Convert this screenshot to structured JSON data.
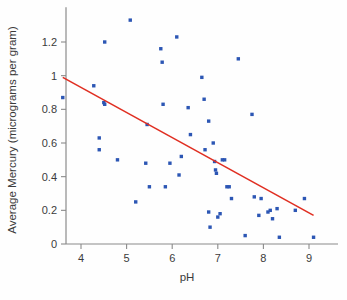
{
  "chart_data": {
    "type": "scatter",
    "title": "",
    "xlabel": "pH",
    "ylabel": "Average Mercury (micrograms per gram)",
    "xlim": [
      3.4,
      9.5
    ],
    "ylim": [
      0,
      1.4
    ],
    "xticks": [
      4,
      5,
      6,
      7,
      8,
      9
    ],
    "xtick_labels": [
      "4",
      "5",
      "6",
      "7",
      "8",
      "9"
    ],
    "yticks": [
      0,
      0.2,
      0.4,
      0.6,
      0.8,
      1,
      1.2
    ],
    "ytick_labels": [
      "0",
      "0.2",
      "0.4",
      "0.6",
      "0.8",
      "1",
      "1.2"
    ],
    "grid": false,
    "legend": "none",
    "point_color": "#2c56b4",
    "line_color": "#e02f22",
    "axis_color": "#8a8a8a",
    "series": [
      {
        "name": "Lakes",
        "marker": "square",
        "points": [
          [
            3.6,
            0.87
          ],
          [
            4.28,
            0.94
          ],
          [
            4.4,
            0.63
          ],
          [
            4.4,
            0.56
          ],
          [
            4.52,
            1.2
          ],
          [
            4.5,
            0.84
          ],
          [
            4.52,
            0.83
          ],
          [
            4.8,
            0.5
          ],
          [
            5.08,
            1.33
          ],
          [
            5.2,
            0.25
          ],
          [
            5.42,
            0.48
          ],
          [
            5.45,
            0.71
          ],
          [
            5.5,
            0.34
          ],
          [
            5.75,
            1.16
          ],
          [
            5.78,
            1.08
          ],
          [
            5.8,
            0.83
          ],
          [
            5.85,
            0.34
          ],
          [
            5.95,
            0.48
          ],
          [
            6.1,
            1.23
          ],
          [
            6.15,
            0.41
          ],
          [
            6.2,
            0.52
          ],
          [
            6.35,
            0.81
          ],
          [
            6.4,
            0.65
          ],
          [
            6.65,
            0.99
          ],
          [
            6.7,
            0.86
          ],
          [
            6.72,
            0.56
          ],
          [
            6.8,
            0.73
          ],
          [
            6.8,
            0.19
          ],
          [
            6.83,
            0.1
          ],
          [
            6.9,
            0.6
          ],
          [
            6.93,
            0.49
          ],
          [
            6.95,
            0.44
          ],
          [
            6.97,
            0.42
          ],
          [
            7.0,
            0.16
          ],
          [
            7.05,
            0.18
          ],
          [
            7.1,
            0.5
          ],
          [
            7.15,
            0.5
          ],
          [
            7.2,
            0.34
          ],
          [
            7.25,
            0.34
          ],
          [
            7.3,
            0.27
          ],
          [
            7.45,
            1.1
          ],
          [
            7.6,
            0.05
          ],
          [
            7.75,
            0.77
          ],
          [
            7.8,
            0.28
          ],
          [
            7.9,
            0.17
          ],
          [
            7.95,
            0.27
          ],
          [
            8.1,
            0.19
          ],
          [
            8.15,
            0.2
          ],
          [
            8.2,
            0.15
          ],
          [
            8.3,
            0.21
          ],
          [
            8.35,
            0.04
          ],
          [
            8.7,
            0.2
          ],
          [
            8.9,
            0.27
          ],
          [
            9.1,
            0.04
          ]
        ]
      }
    ],
    "fit_line": {
      "name": "least-squares regression line",
      "x_start": 3.6,
      "y_start": 0.99,
      "x_end": 9.1,
      "y_end": 0.17
    }
  }
}
